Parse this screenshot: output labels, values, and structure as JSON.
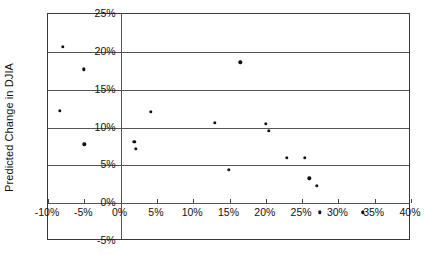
{
  "chart_data": {
    "type": "scatter",
    "title": "",
    "xlabel": "",
    "ylabel": "Predicted Change in DJIA",
    "xlim": [
      -10,
      40
    ],
    "ylim": [
      -5,
      25
    ],
    "xticks": [
      "-10%",
      "-5%",
      "0%",
      "5%",
      "10%",
      "15%",
      "20%",
      "25%",
      "30%",
      "35%",
      "40%"
    ],
    "xtick_values": [
      -10,
      -5,
      0,
      5,
      10,
      15,
      20,
      25,
      30,
      35,
      40
    ],
    "yticks": [
      "-5%",
      "0%",
      "5%",
      "10%",
      "15%",
      "20%",
      "25%"
    ],
    "ytick_values": [
      -5,
      0,
      5,
      10,
      15,
      20,
      25
    ],
    "grid": "horizontal-and-zero-vertical",
    "legend": "none",
    "marker_color": "#111111",
    "frame_color": "#3a3a3a",
    "gridline_color": "#555555",
    "points": [
      {
        "x": -8.0,
        "y": 20.7
      },
      {
        "x": -5.1,
        "y": 17.7
      },
      {
        "x": -8.4,
        "y": 12.2
      },
      {
        "x": -5.0,
        "y": 7.8
      },
      {
        "x": 1.9,
        "y": 8.1
      },
      {
        "x": 2.1,
        "y": 7.2
      },
      {
        "x": 4.2,
        "y": 12.1
      },
      {
        "x": 13.0,
        "y": 10.6
      },
      {
        "x": 16.5,
        "y": 18.6
      },
      {
        "x": 14.9,
        "y": 4.4
      },
      {
        "x": 20.0,
        "y": 10.5
      },
      {
        "x": 20.4,
        "y": 9.6
      },
      {
        "x": 22.9,
        "y": 6.0
      },
      {
        "x": 25.4,
        "y": 6.0
      },
      {
        "x": 26.0,
        "y": 3.3
      },
      {
        "x": 27.0,
        "y": 2.3
      },
      {
        "x": 27.4,
        "y": -1.2
      },
      {
        "x": 33.4,
        "y": -1.2
      }
    ]
  }
}
